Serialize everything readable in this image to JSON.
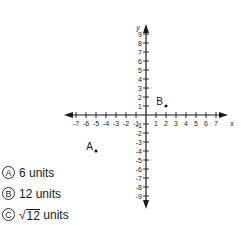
{
  "graph": {
    "x_axis_label": "x",
    "y_axis_label": "y",
    "x_range": [
      -7,
      7
    ],
    "y_range": [
      -9,
      9
    ],
    "x_ticks": [
      -7,
      -6,
      -5,
      -4,
      -3,
      -2,
      -1,
      1,
      2,
      3,
      4,
      5,
      6,
      7
    ],
    "y_ticks": [
      9,
      8,
      7,
      6,
      5,
      4,
      3,
      2,
      1,
      -1,
      -2,
      -3,
      -4,
      -5,
      -6,
      -7,
      -8,
      -9
    ],
    "points": [
      {
        "label": "A",
        "x": -5,
        "y": -4
      },
      {
        "label": "B",
        "x": 2,
        "y": 1
      }
    ],
    "colors": {
      "axis": "#1a1a1a",
      "text": "#222222"
    }
  },
  "choices": [
    {
      "letter": "A",
      "text": "6 units"
    },
    {
      "letter": "B",
      "text": "12 units"
    },
    {
      "letter": "C",
      "radicand": "12",
      "suffix": " units"
    }
  ]
}
